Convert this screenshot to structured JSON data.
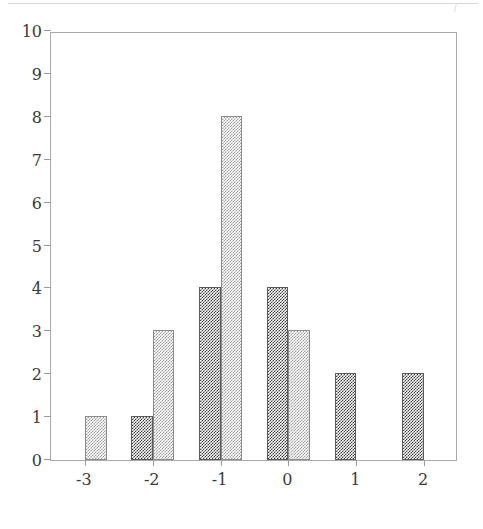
{
  "chart_data": {
    "type": "bar",
    "title": "",
    "subtitle": "",
    "xlabel": "",
    "ylabel": "",
    "categories": [
      "-3",
      "-2",
      "-1",
      "0",
      "1",
      "2"
    ],
    "x": [
      -3,
      -2,
      -1,
      0,
      1,
      2
    ],
    "series": [
      {
        "name": "dark",
        "color": "#3c3c3c",
        "fill": "dense-checker-dither",
        "values": [
          0,
          1,
          4,
          4,
          2,
          2
        ]
      },
      {
        "name": "light",
        "color": "#9f9f9f",
        "fill": "sparse-checker-dither",
        "values": [
          1,
          3,
          8,
          3,
          0,
          0
        ]
      }
    ],
    "ylim": [
      0,
      10
    ],
    "xlim": [
      -3.5,
      2.5
    ],
    "y_ticks": [
      0,
      1,
      2,
      3,
      4,
      5,
      6,
      7,
      8,
      9,
      10
    ],
    "y_tick_labels": [
      "0",
      "1",
      "2",
      "3",
      "4",
      "5",
      "6",
      "7",
      "8",
      "9",
      "10"
    ],
    "x_ticks": [
      -3,
      -2,
      -1,
      0,
      1,
      2
    ],
    "x_tick_labels": [
      "-3",
      "-2",
      "-1",
      "0",
      "1",
      "2"
    ],
    "grid": false,
    "legend": null,
    "legend_position": "none",
    "annotations": [],
    "frame": "box",
    "bar_layout": "grouped-straddling-tick",
    "background_color": "#ffffff",
    "axis_color": "#a9a9a9",
    "text_color": "#3a3a3a"
  }
}
